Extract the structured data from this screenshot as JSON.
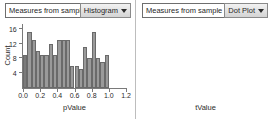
{
  "panels": [
    {
      "title": "Measures from sample",
      "plot_type_label": "Histogram",
      "caret_icon": "chevron-down-icon"
    },
    {
      "title": "Measures from sample",
      "plot_type_label": "Dot Plot",
      "caret_icon": "chevron-down-icon"
    }
  ],
  "chart_data": [
    {
      "type": "bar",
      "title": "Measures from sample",
      "xlabel": "pValue",
      "ylabel": "Count",
      "xlim": [
        0.0,
        1.2
      ],
      "ylim": [
        0,
        17
      ],
      "xticks": [
        "0.0",
        "0.2",
        "0.4",
        "0.6",
        "0.8",
        "1.0",
        "1.2"
      ],
      "xtick_values": [
        0.0,
        0.2,
        0.4,
        0.6,
        0.8,
        1.0,
        1.2
      ],
      "yticks": [
        "4",
        "8",
        "12",
        "16"
      ],
      "ytick_values": [
        4,
        8,
        12,
        16
      ],
      "bin_width": 0.05,
      "bin_starts": [
        0.0,
        0.05,
        0.1,
        0.15,
        0.2,
        0.25,
        0.3,
        0.35,
        0.4,
        0.45,
        0.5,
        0.55,
        0.6,
        0.65,
        0.7,
        0.75,
        0.8,
        0.85,
        0.9,
        0.95
      ],
      "values": [
        9,
        15,
        13,
        10,
        9,
        9,
        12,
        9,
        13,
        13,
        13,
        6,
        6,
        5,
        11,
        8,
        15,
        8,
        7,
        9
      ],
      "grid": false,
      "legend": false
    },
    {
      "type": "scatter",
      "title": "Measures from sample",
      "xlabel": "tValue",
      "ylabel": "",
      "xlim": [
        2.44,
        3.14
      ],
      "xticks": [
        "2.5",
        "2.6",
        "2.7",
        "2.8",
        "2.9",
        "3.0",
        "3.1"
      ],
      "xtick_values": [
        2.5,
        2.6,
        2.7,
        2.8,
        2.9,
        3.0,
        3.1
      ],
      "x": [
        2.5,
        2.6,
        2.645,
        2.665,
        2.725,
        2.765,
        2.805
      ],
      "y": [
        1,
        1,
        1,
        1,
        1,
        1,
        1
      ],
      "grid": false,
      "legend": false
    }
  ]
}
